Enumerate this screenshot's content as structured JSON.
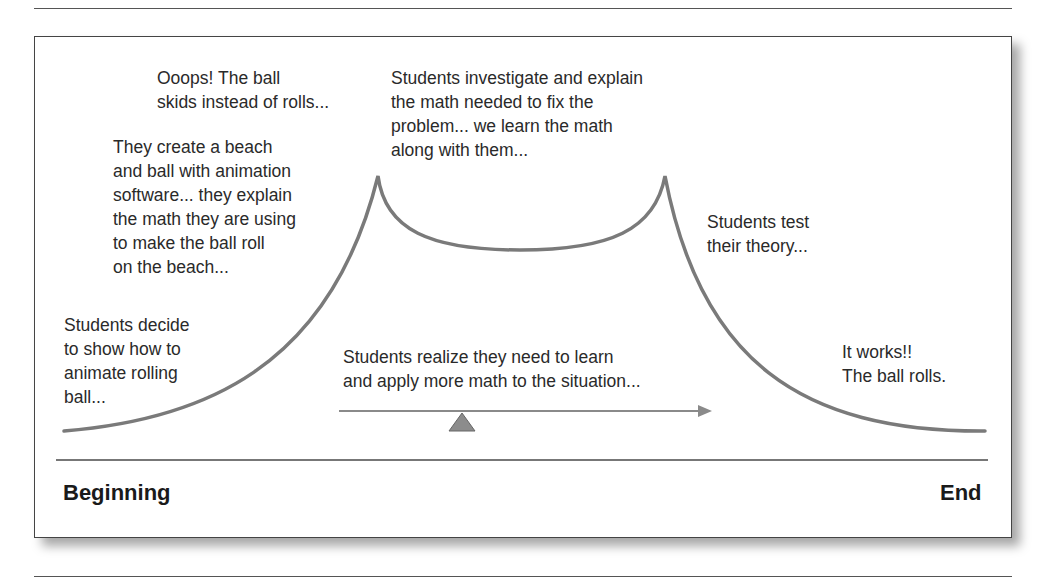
{
  "diagram": {
    "stages": [
      {
        "id": "decide",
        "text": "Students decide\nto show how to\nanimate rolling\nball..."
      },
      {
        "id": "create",
        "text": "They create a beach\nand ball with animation\nsoftware... they explain\nthe math they are using\nto make the ball roll\non the beach..."
      },
      {
        "id": "ooops",
        "text": "Ooops! The ball\nskids instead of rolls..."
      },
      {
        "id": "investigate",
        "text": "Students investigate and explain\nthe math needed to fix the\nproblem... we learn the math\nalong with them..."
      },
      {
        "id": "test",
        "text": "Students test\ntheir theory..."
      },
      {
        "id": "works",
        "text": "It works!!\nThe ball rolls."
      }
    ],
    "realize_text": "Students realize they need to learn\nand apply more math to the situation...",
    "axis": {
      "start": "Beginning",
      "end": "End"
    },
    "colors": {
      "curve": "#7a7a7a",
      "arrow": "#8a8a8a",
      "fulcrum": "#8c8c8c",
      "text": "#2a2a2a"
    }
  }
}
